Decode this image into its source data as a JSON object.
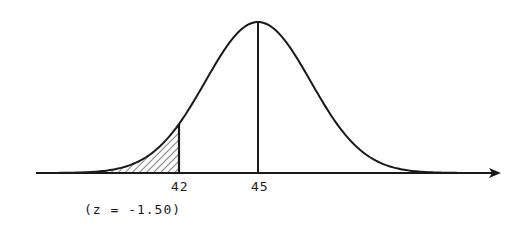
{
  "chart_data": {
    "type": "area",
    "title": "",
    "xlabel": "",
    "ylabel": "",
    "distribution": "normal",
    "mean": 45,
    "z_score": -1.5,
    "shaded_region": {
      "from": "-inf",
      "to": 42,
      "pattern": "diagonal-hatch"
    },
    "vertical_lines": [
      42,
      45
    ],
    "tick_labels": [
      "42",
      "45"
    ],
    "annotations": [
      "(z = -1.50)"
    ],
    "grid": false,
    "legend": null
  },
  "labels": {
    "tick_42": "42",
    "tick_45": "45",
    "z_annotation": "(z = -1.50)"
  },
  "colors": {
    "ink": "#1a1a1a",
    "background": "#ffffff"
  }
}
